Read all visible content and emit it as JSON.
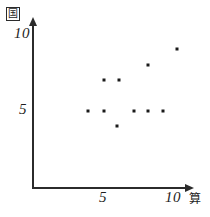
{
  "chart_data": {
    "type": "scatter",
    "title": "",
    "xlabel": "算",
    "ylabel": "国",
    "xlim": [
      0,
      10.8
    ],
    "ylim": [
      0,
      10.9
    ],
    "grid": false,
    "legend": "none",
    "x_ticks": [
      5,
      10
    ],
    "x_tick_labels": [
      "5",
      "10"
    ],
    "y_ticks": [
      5,
      10
    ],
    "y_tick_labels": [
      "5",
      "10"
    ],
    "point_color": "#1a1a1a",
    "axis_color": "#2b2b2b",
    "points": [
      {
        "x": 3.8,
        "y": 5.0
      },
      {
        "x": 4.9,
        "y": 5.0
      },
      {
        "x": 7.0,
        "y": 5.0
      },
      {
        "x": 8.0,
        "y": 5.0
      },
      {
        "x": 9.0,
        "y": 5.0
      },
      {
        "x": 4.9,
        "y": 7.0
      },
      {
        "x": 6.0,
        "y": 7.0
      },
      {
        "x": 8.0,
        "y": 8.0
      },
      {
        "x": 10.0,
        "y": 9.0
      },
      {
        "x": 5.8,
        "y": 4.0
      }
    ]
  },
  "axes": {
    "y_title": "国",
    "x_title": "算",
    "y_tick_top_label": "10",
    "y_tick_mid_label": "5",
    "x_tick_mid_label": "5",
    "x_tick_right_label": "10"
  }
}
